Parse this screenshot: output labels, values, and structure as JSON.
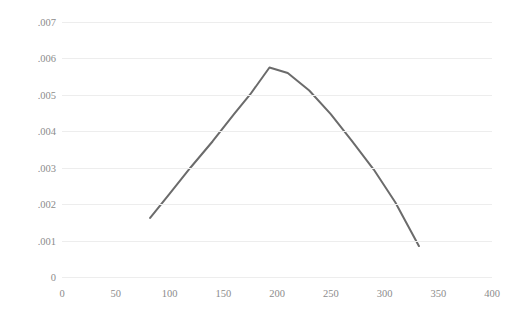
{
  "chart_data": {
    "type": "line",
    "title": "",
    "xlabel": "",
    "ylabel": "",
    "grid": true,
    "legend": false,
    "xlim": [
      0,
      400
    ],
    "ylim": [
      0,
      0.007
    ],
    "xticks": [
      "0",
      "50",
      "100",
      "150",
      "200",
      "250",
      "300",
      "350",
      "400"
    ],
    "xtick_values": [
      0,
      50,
      100,
      150,
      200,
      250,
      300,
      350,
      400
    ],
    "yticks": [
      "0",
      ".001",
      ".002",
      ".003",
      ".004",
      ".005",
      ".006",
      ".007"
    ],
    "ytick_values": [
      0,
      0.001,
      0.002,
      0.003,
      0.004,
      0.005,
      0.006,
      0.007
    ],
    "series": [
      {
        "name": "",
        "color": "#6b6b6b",
        "x": [
          82,
          100,
          120,
          140,
          160,
          175,
          193,
          210,
          230,
          250,
          270,
          290,
          310,
          332
        ],
        "values": [
          0.00162,
          0.00228,
          0.00302,
          0.00372,
          0.00447,
          0.00501,
          0.00575,
          0.0056,
          0.00512,
          0.00447,
          0.00372,
          0.00295,
          0.00205,
          0.00085
        ]
      }
    ]
  },
  "axes": {
    "line_color": "#6b6b6b",
    "grid_color": "#ededed",
    "tick_label_color": "#8c8c8c"
  }
}
